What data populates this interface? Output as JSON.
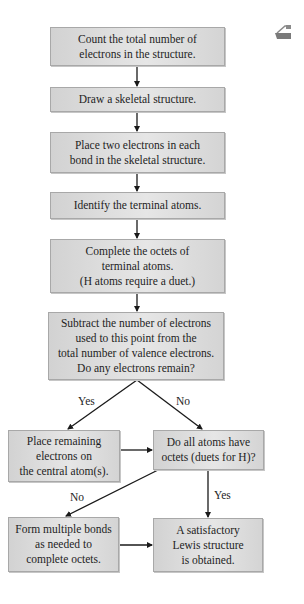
{
  "flowchart": {
    "title_icon": "printer-corner-icon",
    "steps": {
      "count": "Count the total number of\nelectrons in the structure.",
      "skeleton": "Draw a skeletal structure.",
      "place_two": "Place two electrons in each\nbond in the skeletal structure.",
      "identify": "Identify the terminal atoms.",
      "complete": "Complete the octets of\nterminal atoms.\n(H atoms require a duet.)",
      "subtract": "Subtract the number of electrons\nused to this point from the\ntotal number of valence electrons.\nDo any electrons remain?",
      "place_remaining": "Place remaining\nelectrons on\nthe central atom(s).",
      "check_octets": "Do all atoms have\noctets (duets for H)?",
      "multiple_bonds": "Form multiple bonds\nas needed to\ncomplete octets.",
      "result": "A satisfactory\nLewis structure\nis obtained."
    },
    "edge_labels": {
      "subtract_yes": "Yes",
      "subtract_no": "No",
      "check_no": "No",
      "check_yes": "Yes"
    }
  }
}
